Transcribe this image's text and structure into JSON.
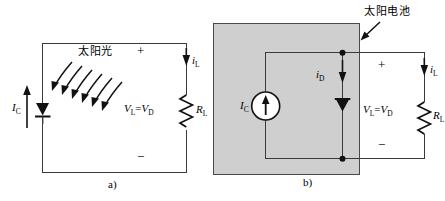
{
  "figure": {
    "type": "circuit-diagram",
    "background": "#ffffff",
    "wire_color": "#3a3a3a",
    "shade_color": "#cfcfcf"
  },
  "panel_a": {
    "caption": "a)",
    "sunlight_label": "太阳光",
    "plus_sign": "+",
    "minus_sign": "−",
    "voltage_label_v": "V",
    "voltage_label_sub_l": "L",
    "voltage_label_eq": "=",
    "voltage_label_v2": "V",
    "voltage_label_sub_d": "D",
    "source_current_label": "I",
    "source_current_sub": "C",
    "load_current_label": "i",
    "load_current_sub": "L",
    "resistor_label": "R",
    "resistor_sub": "L",
    "sun_arrow_count": 6,
    "diode_name": "photodiode",
    "resistor_name": "load-resistor"
  },
  "panel_b": {
    "caption": "b)",
    "annotation_label": "太阳电池",
    "plus_sign": "+",
    "minus_sign": "−",
    "voltage_label_v": "V",
    "voltage_label_sub_l": "L",
    "voltage_label_eq": "=",
    "voltage_label_v2": "V",
    "voltage_label_sub_d": "D",
    "source_current_label": "I",
    "source_current_sub": "C",
    "diode_current_label": "i",
    "diode_current_sub": "D",
    "load_current_label": "i",
    "load_current_sub": "L",
    "resistor_label": "R",
    "resistor_sub": "L",
    "current_source_name": "photocurrent-source",
    "diode_name": "shunt-diode",
    "resistor_name": "load-resistor"
  }
}
